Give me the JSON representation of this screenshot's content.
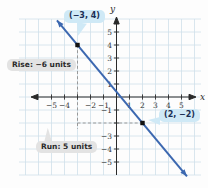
{
  "theme": {
    "background": "#fdfdfd",
    "grid_color": "#cfe0ea",
    "axis_color": "#2a2a2a",
    "tick_label_color": "#333333",
    "line_color": "#3c68b0",
    "point_color": "#111111",
    "dash_color": "#999999",
    "callout_blue_bg": "#cfe9f6",
    "callout_gray_bg": "#e3e3e3"
  },
  "chart_data": {
    "type": "line",
    "title": "",
    "xlabel": "x",
    "ylabel": "y",
    "xlim": [
      -7.5,
      6.5
    ],
    "ylim": [
      -6,
      6
    ],
    "grid": true,
    "slope": -1.2,
    "y_intercept": 0.4,
    "line_x_span": [
      -4.58,
      5.42
    ],
    "points": [
      {
        "x": -3,
        "y": 4,
        "label": "(−3, 4)"
      },
      {
        "x": 2,
        "y": -2,
        "label": "(2, −2)"
      }
    ],
    "x_tick_values": [
      -5,
      -4,
      -3,
      -2,
      -1,
      1,
      2,
      3,
      4,
      5
    ],
    "x_tick_labels": [
      "−5",
      "−4",
      "",
      "−2",
      "−1",
      "1",
      "2",
      "3",
      "4",
      "5"
    ],
    "y_tick_values": [
      5,
      4,
      3,
      2,
      1,
      -1,
      -2,
      -3,
      -4,
      -5
    ],
    "y_tick_labels": [
      "5",
      "4",
      "3",
      "2",
      "1",
      "−1",
      "",
      "−3",
      "−4",
      "−5"
    ],
    "dashed_segments": [
      {
        "x1": -3,
        "y1": 4,
        "x2": -3,
        "y2": -2.45
      },
      {
        "x1": -3,
        "y1": -2,
        "x2": 2,
        "y2": -2
      }
    ],
    "annotations": {
      "rise": {
        "text": "Rise: −6 units",
        "value": -6
      },
      "run": {
        "text": "Run: 5 units",
        "value": 5
      }
    }
  }
}
